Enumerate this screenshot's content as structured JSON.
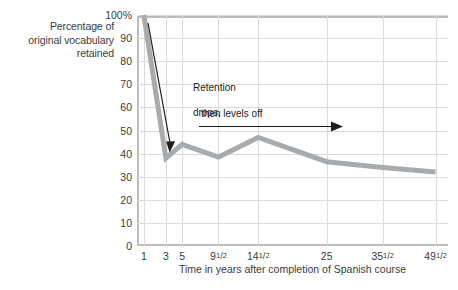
{
  "chart_data": {
    "type": "line",
    "title": "",
    "subtitle": "",
    "ylabel": "Percentage of original vocabulary retained",
    "xlabel": "Time in years after completion of Spanish course",
    "categories": [
      "1",
      "3",
      "5",
      "9½",
      "14½",
      "25",
      "35½",
      "49½"
    ],
    "x_tick_labels": [
      {
        "text": "1",
        "whole": "1",
        "frac": ""
      },
      {
        "text": "3",
        "whole": "3",
        "frac": ""
      },
      {
        "text": "5",
        "whole": "5",
        "frac": ""
      },
      {
        "text": "9½",
        "whole": "9",
        "frac": "1/2"
      },
      {
        "text": "14½",
        "whole": "14",
        "frac": "1/2"
      },
      {
        "text": "25",
        "whole": "25",
        "frac": ""
      },
      {
        "text": "35½",
        "whole": "35",
        "frac": "1/2"
      },
      {
        "text": "49½",
        "whole": "49",
        "frac": "1/2"
      }
    ],
    "y_tick_labels": [
      "100%",
      "90",
      "80",
      "70",
      "60",
      "50",
      "40",
      "30",
      "20",
      "10",
      "0"
    ],
    "y_tick_values": [
      100,
      90,
      80,
      70,
      60,
      50,
      40,
      30,
      20,
      10,
      0
    ],
    "ylim": [
      0,
      100
    ],
    "values": [
      100,
      38,
      44,
      38.5,
      47,
      36.5,
      34,
      32
    ],
    "series": [
      {
        "name": "Percentage of original vocabulary retained",
        "color": "#a8abad",
        "values": [
          100,
          38,
          44,
          38.5,
          47,
          36.5,
          34,
          32
        ]
      }
    ],
    "grid": {
      "horizontal": true,
      "vertical": true,
      "color": "#d8dadb"
    },
    "legend": {
      "visible": false,
      "position": ""
    },
    "annotations": [
      {
        "name": "retention-drops",
        "text": "Retention\ndrops,",
        "arrow": "diagonal-down",
        "color": "#1d1d1d"
      },
      {
        "name": "then-levels-off",
        "text": "then levels off",
        "arrow": "horizontal-right",
        "color": "#1d1d1d"
      }
    ],
    "axis_color": "#b9bcbe",
    "background": "#ffffff"
  },
  "labels": {
    "y_axis_title_line1": "Percentage of",
    "y_axis_title_line2": "original vocabulary",
    "y_axis_title_line3": "retained",
    "x_axis_title": "Time in years after completion of Spanish course",
    "annotation_drops_line1": "Retention",
    "annotation_drops_line2": "drops,",
    "annotation_levels": "then levels off"
  }
}
